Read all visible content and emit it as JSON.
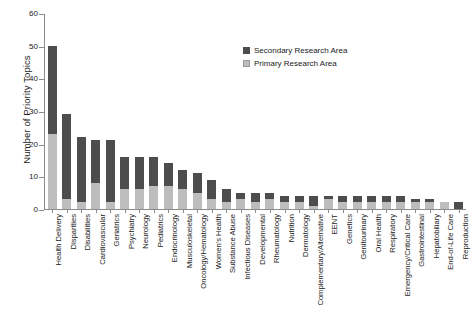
{
  "chart_data": {
    "type": "bar",
    "subtype": "stacked-bar",
    "title": "",
    "xlabel": "",
    "ylabel": "Number of Priority Topics",
    "ylim": [
      0,
      60
    ],
    "yticks": [
      0,
      10,
      20,
      30,
      40,
      50,
      60
    ],
    "grid": false,
    "legend_position": "upper-right-inside",
    "categories": [
      "Health Delivery",
      "Disparities",
      "Disabilities",
      "Cardiovascular",
      "Geriatrics",
      "Psychiatry",
      "Neurology",
      "Pediatrics",
      "Endocrinology",
      "Musculoskeletal",
      "Oncology/Hematology",
      "Women's Health",
      "Substance Abuse",
      "Infectious Diseases",
      "Developmental",
      "Rheumatology",
      "Nutrition",
      "Dermatology",
      "Complementary/Alternative",
      "EENT",
      "Genetics",
      "Genitourinary",
      "Oral Health",
      "Respiratory",
      "Emergency/Critical Care",
      "Gastrointestinal",
      "Hepatobiliary",
      "End-of-Life Care",
      "Reproduction"
    ],
    "series": [
      {
        "name": "Primary Research Area",
        "color": "#bdbdbd",
        "values": [
          23,
          3,
          2,
          8,
          2,
          6,
          6,
          7,
          7,
          6,
          5,
          3,
          2,
          3,
          2,
          3,
          2,
          2,
          1,
          3,
          2,
          2,
          2,
          2,
          2,
          2,
          2,
          2,
          0
        ]
      },
      {
        "name": "Secondary Research Area",
        "color": "#4d4d4d",
        "values": [
          27,
          26,
          20,
          13,
          19,
          10,
          10,
          9,
          7,
          6,
          6,
          6,
          4,
          2,
          3,
          2,
          2,
          2,
          3,
          1,
          2,
          2,
          2,
          2,
          2,
          1,
          1,
          0,
          2
        ]
      }
    ],
    "totals": [
      50,
      29,
      22,
      21,
      21,
      16,
      16,
      16,
      14,
      12,
      11,
      9,
      6,
      5,
      5,
      5,
      4,
      4,
      4,
      4,
      4,
      4,
      4,
      4,
      4,
      3,
      3,
      2,
      2
    ]
  },
  "legend": {
    "entries": [
      {
        "label": "Secondary Research Area",
        "swatch": "secondary"
      },
      {
        "label": "Primary Research Area",
        "swatch": "primary"
      }
    ]
  },
  "axes": {
    "y_title": "Number of Priority Topics",
    "y_tick_labels": [
      "60",
      "50",
      "40",
      "30",
      "20",
      "10",
      "0"
    ]
  }
}
